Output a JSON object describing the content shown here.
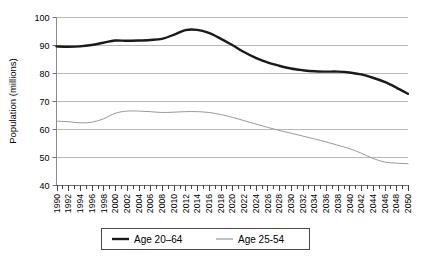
{
  "chart_data": {
    "type": "line",
    "title": "",
    "xlabel": "",
    "ylabel": "Population (millions)",
    "xlim": [
      1990,
      2050
    ],
    "ylim": [
      40,
      100
    ],
    "yticks": [
      40,
      50,
      60,
      70,
      80,
      90,
      100
    ],
    "ytick_labels": [
      "40",
      "50",
      "60",
      "70",
      "80",
      "90",
      "100"
    ],
    "grid": true,
    "grid_axis": "y",
    "legend_position": "bottom",
    "x": [
      1990,
      1992,
      1994,
      1996,
      1998,
      2000,
      2002,
      2004,
      2006,
      2008,
      2010,
      2012,
      2014,
      2016,
      2018,
      2020,
      2022,
      2024,
      2026,
      2028,
      2030,
      2032,
      2034,
      2036,
      2038,
      2040,
      2042,
      2044,
      2046,
      2048,
      2050
    ],
    "xtick_labels": [
      "1990",
      "1992",
      "1994",
      "1996",
      "1998",
      "2000",
      "2002",
      "2004",
      "2006",
      "2008",
      "2010",
      "2012",
      "2014",
      "2016",
      "2018",
      "2020",
      "2022",
      "2024",
      "2026",
      "2028",
      "2030",
      "2032",
      "2034",
      "2036",
      "2038",
      "2040",
      "2042",
      "2044",
      "2046",
      "2048",
      "2050"
    ],
    "series": [
      {
        "name": "Age 20–64",
        "color": "#1a1a1a",
        "width": 2.4,
        "values": [
          89.5,
          89.4,
          89.5,
          90.0,
          90.8,
          91.6,
          91.5,
          91.6,
          91.8,
          92.2,
          93.6,
          95.3,
          95.4,
          94.3,
          92.3,
          90.0,
          87.5,
          85.4,
          83.8,
          82.6,
          81.6,
          81.0,
          80.6,
          80.5,
          80.5,
          80.2,
          79.5,
          78.3,
          76.8,
          74.8,
          72.6
        ]
      },
      {
        "name": "Age 25-54",
        "color": "#9a9a9a",
        "width": 1.0,
        "values": [
          62.8,
          62.6,
          62.2,
          62.4,
          63.6,
          65.6,
          66.4,
          66.4,
          66.2,
          65.9,
          66.0,
          66.2,
          66.2,
          65.9,
          65.2,
          64.2,
          63.0,
          61.8,
          60.6,
          59.5,
          58.5,
          57.5,
          56.5,
          55.4,
          54.2,
          53.0,
          51.4,
          49.5,
          48.2,
          47.8,
          47.6
        ]
      }
    ]
  },
  "legend": {
    "items": [
      {
        "label": "Age 20–64",
        "color": "#1a1a1a",
        "width": 2.4
      },
      {
        "label": "Age 25-54",
        "color": "#9a9a9a",
        "width": 1.0
      }
    ]
  }
}
